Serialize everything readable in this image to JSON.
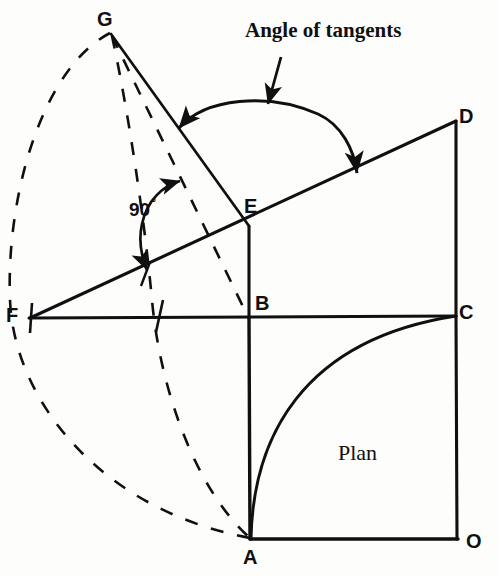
{
  "figure": {
    "kind": "engineering-drawing",
    "background_color": "#fdfdfc",
    "ink_color": "#101010"
  },
  "annotations": {
    "angle_of_tangents": "Angle of tangents",
    "plan": "Plan",
    "right_angle": "90",
    "degree_symbol": "°"
  },
  "vertices": [
    {
      "id": "G",
      "label": "G",
      "x": 110,
      "y": 33,
      "role": "apex"
    },
    {
      "id": "D",
      "label": "D",
      "x": 455,
      "y": 120,
      "role": "elevation-corner"
    },
    {
      "id": "E",
      "label": "E",
      "x": 248,
      "y": 225,
      "role": "tangent-point"
    },
    {
      "id": "B",
      "label": "B",
      "x": 248,
      "y": 317,
      "role": "plan-corner"
    },
    {
      "id": "F",
      "label": "F",
      "x": 30,
      "y": 318,
      "role": "baseline-left"
    },
    {
      "id": "C",
      "label": "C",
      "x": 455,
      "y": 315,
      "role": "plan-corner"
    },
    {
      "id": "A",
      "label": "A",
      "x": 250,
      "y": 538,
      "role": "plan-corner"
    },
    {
      "id": "O",
      "label": "O",
      "x": 457,
      "y": 538,
      "role": "plan-origin"
    }
  ],
  "solid_lines": [
    {
      "name": "line-F-D",
      "from": "F",
      "to": "D"
    },
    {
      "name": "line-F-C",
      "from": "F",
      "to": "C"
    },
    {
      "name": "line-G-E",
      "from": "G",
      "to": "E"
    },
    {
      "name": "line-E-B",
      "from": "E",
      "to": "B"
    },
    {
      "name": "line-B-A",
      "from": "B",
      "to": "A"
    },
    {
      "name": "line-D-C",
      "from": "D",
      "to": "C"
    },
    {
      "name": "line-C-O",
      "from": "C",
      "to": "O"
    },
    {
      "name": "line-A-O",
      "from": "A",
      "to": "O"
    }
  ],
  "dashed_lines": [
    {
      "name": "dashed-line-G-B",
      "from": "G",
      "to": "B"
    }
  ],
  "dashed_arcs": [
    {
      "name": "dashed-arc-outer-G-to-A",
      "from": "G",
      "through_x": 8,
      "to": "A"
    },
    {
      "name": "dashed-arc-inner-G-to-A",
      "from": "G",
      "through_x": 150,
      "to": "A"
    }
  ],
  "solid_arcs": [
    {
      "name": "plan-quarter-arc-A-to-C",
      "from": "A",
      "to": "C"
    }
  ],
  "measure_arcs": [
    {
      "name": "angle-of-tangents-arc",
      "arrows": "both",
      "from_x": 178,
      "from_y": 127,
      "to_x": 356,
      "to_y": 173
    },
    {
      "name": "right-angle-arc",
      "arrows": "both",
      "from_x": 182,
      "top": 180,
      "to_x": 147,
      "to_y": 271
    }
  ],
  "leader_arrows": [
    {
      "name": "angle-of-tangents-leader",
      "from_x": 280,
      "from_y": 58,
      "to_x": 268,
      "to_y": 106
    }
  ],
  "tick_marks": [
    {
      "name": "tick-on-FC-midpoint",
      "x": 158,
      "y": 318
    },
    {
      "name": "tick-at-F",
      "x": 30,
      "y": 318
    }
  ]
}
